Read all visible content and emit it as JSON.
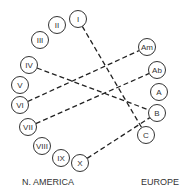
{
  "labels": {
    "left": "N. AMERICA",
    "right": "EUROPE"
  },
  "left_nodes": [
    {
      "id": "I",
      "x": 78,
      "y": 19
    },
    {
      "id": "II",
      "x": 57,
      "y": 25
    },
    {
      "id": "III",
      "x": 40,
      "y": 40
    },
    {
      "id": "IV",
      "x": 29,
      "y": 65
    },
    {
      "id": "V",
      "x": 20,
      "y": 85
    },
    {
      "id": "VI",
      "x": 20,
      "y": 105
    },
    {
      "id": "VII",
      "x": 28,
      "y": 127
    },
    {
      "id": "VIII",
      "x": 42,
      "y": 146
    },
    {
      "id": "IX",
      "x": 61,
      "y": 158
    },
    {
      "id": "X",
      "x": 80,
      "y": 163
    }
  ],
  "right_nodes": [
    {
      "id": "Am",
      "x": 147,
      "y": 47
    },
    {
      "id": "Ab",
      "x": 157,
      "y": 70
    },
    {
      "id": "A",
      "x": 159,
      "y": 92
    },
    {
      "id": "B",
      "x": 157,
      "y": 113
    },
    {
      "id": "C",
      "x": 146,
      "y": 135
    }
  ],
  "links": [
    {
      "from": "I",
      "to": "C"
    },
    {
      "from": "IV",
      "to": "B"
    },
    {
      "from": "VI",
      "to": "Am"
    },
    {
      "from": "VII",
      "to": "Ab"
    },
    {
      "from": "X",
      "to": "B"
    }
  ]
}
